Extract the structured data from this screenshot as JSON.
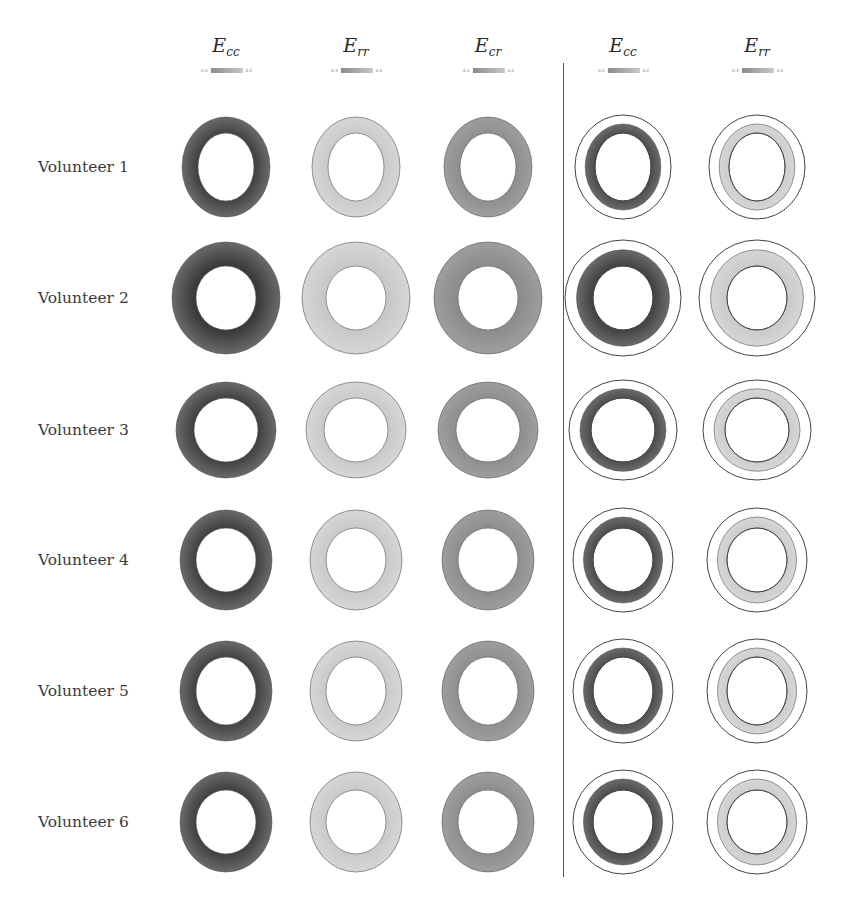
{
  "figure": {
    "columns": [
      {
        "id": "ecc_hd",
        "label_base": "E",
        "label_sub": "cc",
        "x": 226,
        "colorbar": {
          "min": "-0.2",
          "max": "0.2"
        },
        "group": "left"
      },
      {
        "id": "err_hd",
        "label_base": "E",
        "label_sub": "rr",
        "x": 356,
        "colorbar": {
          "min": "-0.4",
          "max": "0.4"
        },
        "group": "left"
      },
      {
        "id": "ecr_hd",
        "label_base": "E",
        "label_sub": "cr",
        "x": 488,
        "colorbar": {
          "min": "-0.2",
          "max": "0.2"
        },
        "group": "left"
      },
      {
        "id": "ecc_mod",
        "label_base": "E",
        "label_sub": "cc",
        "x": 623,
        "colorbar": {
          "min": "-0.2",
          "max": "0.2"
        },
        "group": "right"
      },
      {
        "id": "err_mod",
        "label_base": "E",
        "label_sub": "rr",
        "x": 757,
        "colorbar": {
          "min": "-0.4",
          "max": "0.4"
        },
        "group": "right"
      }
    ],
    "rows": [
      {
        "label": "Volunteer 1",
        "y": 167
      },
      {
        "label": "Volunteer 2",
        "y": 298
      },
      {
        "label": "Volunteer 3",
        "y": 430
      },
      {
        "label": "Volunteer 4",
        "y": 560
      },
      {
        "label": "Volunteer 5",
        "y": 691
      },
      {
        "label": "Volunteer 6",
        "y": 822
      }
    ],
    "colors": {
      "dark_strain": "#3a3a3a",
      "mid_strain": "#8c8c8c",
      "light_strain": "#c8c8c8",
      "outline": "#444444",
      "divider": "#555555"
    }
  }
}
